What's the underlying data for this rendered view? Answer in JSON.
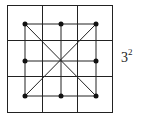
{
  "diagram": {
    "grid": {
      "cols": 3,
      "rows": 3,
      "x0": 7,
      "y0": 5,
      "x1": 112,
      "y1": 112,
      "lines_x": [
        42,
        77
      ],
      "lines_y": [
        40,
        76
      ]
    },
    "dots": [
      {
        "x": 25,
        "y": 24
      },
      {
        "x": 61,
        "y": 24
      },
      {
        "x": 96,
        "y": 24
      },
      {
        "x": 25,
        "y": 61
      },
      {
        "x": 96,
        "y": 61
      },
      {
        "x": 25,
        "y": 96
      },
      {
        "x": 61,
        "y": 96
      },
      {
        "x": 96,
        "y": 96
      }
    ],
    "label": {
      "base": "3",
      "exponent": "2"
    },
    "stroke_color": "#222222"
  }
}
